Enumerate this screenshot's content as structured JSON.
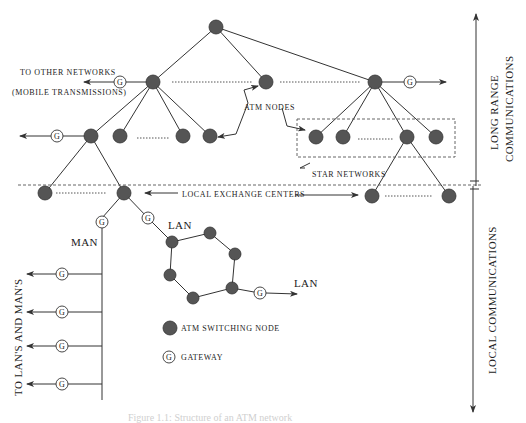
{
  "diagram": {
    "labels": {
      "to_other_networks": "TO OTHER NETWORKS",
      "mobile_transmissions": "(MOBILE TRANSMISSIONS)",
      "atm_nodes": "ATM NODES",
      "star_networks": "STAR NETWORKS",
      "local_exchange_centers": "LOCAL EXCHANGE CENTERS",
      "man": "MAN",
      "lan_ring": "LAN",
      "lan_out": "LAN",
      "to_lans_and_mans": "TO LAN'S AND MAN'S",
      "long_range_1": "LONG RANGE",
      "long_range_2": "COMMUNICATIONS",
      "local_comm": "LOCAL COMMUNICATIONS",
      "gateway_glyph": "G",
      "caption": "Figure 1.1: Structure of an ATM network"
    },
    "legend": {
      "switching_node": "ATM SWITCHING NODE",
      "gateway": "GATEWAY"
    },
    "colors": {
      "node_fill": "#555555",
      "line": "#333333",
      "background": "#ffffff"
    }
  }
}
